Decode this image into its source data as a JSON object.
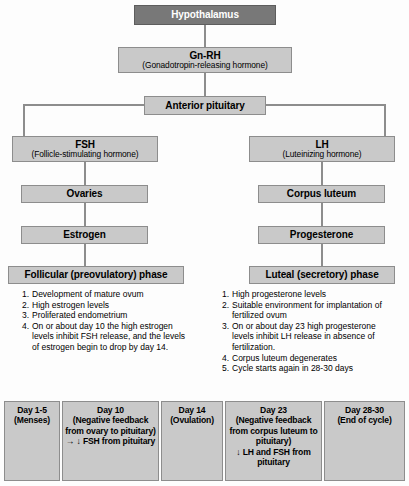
{
  "diagram": {
    "colors": {
      "box_fill": "#c9c9c9",
      "box_border": "#8d8d8d",
      "dark_box_fill": "#787878",
      "text": "#000000",
      "dark_box_text": "#ffffff",
      "background": "#ffffff"
    },
    "nodes": {
      "hypothalamus": {
        "label": "Hypothalamus"
      },
      "gnrh": {
        "label": "Gn-RH",
        "sub": "(Gonadotropin-releasing hormone)"
      },
      "anterior_pituitary": {
        "label": "Anterior pituitary"
      },
      "fsh": {
        "label": "FSH",
        "sub": "(Follicle-stimulating hormone)"
      },
      "lh": {
        "label": "LH",
        "sub": "(Luteinizing hormone)"
      },
      "ovaries": {
        "label": "Ovaries"
      },
      "corpus_luteum": {
        "label": "Corpus luteum"
      },
      "estrogen": {
        "label": "Estrogen"
      },
      "progesterone": {
        "label": "Progesterone"
      },
      "follicular_phase": {
        "label": "Follicular (preovulatory) phase"
      },
      "luteal_phase": {
        "label": "Luteal (secretory) phase"
      }
    },
    "follicular_items": [
      {
        "num": "1.",
        "text": "Development of mature ovum"
      },
      {
        "num": "2.",
        "text": "High estrogen levels"
      },
      {
        "num": "3.",
        "text": "Proliferated endometrium"
      },
      {
        "num": "4.",
        "text": "On or about day 10 the high estrogen levels inhibit FSH release, and the levels of estrogen begin to drop by day 14."
      }
    ],
    "luteal_items": [
      {
        "num": "1.",
        "text": "High progesterone levels"
      },
      {
        "num": "2.",
        "text": "Suitable environment for implantation of fertilized ovum"
      },
      {
        "num": "3.",
        "text": "On or about day 23 high progesterone levels inhibit LH release in absence of fertilization."
      },
      {
        "num": "4.",
        "text": "Corpus luteum degenerates"
      },
      {
        "num": "5.",
        "text": "Cycle starts again in 28-30 days"
      }
    ],
    "timeline": [
      {
        "title": "Day 1-5",
        "detail": "(Menses)"
      },
      {
        "title": "Day 10",
        "detail": "(Negative feedback from ovary to pituitary)\n→ ↓ FSH from pituitary"
      },
      {
        "title": "Day 14",
        "detail": "(Ovulation)"
      },
      {
        "title": "Day 23",
        "detail": "(Negative feedback from corpus luteum to pituitary)\n↓ LH and FSH from pituitary"
      },
      {
        "title": "Day 28-30",
        "detail": "(End of cycle)"
      }
    ]
  }
}
